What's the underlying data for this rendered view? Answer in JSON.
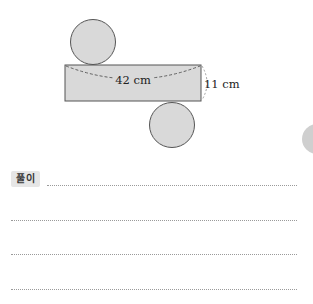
{
  "figure": {
    "width_label": "42 cm",
    "height_label": "11 cm",
    "colors": {
      "fill": "#d9d9d9",
      "stroke": "#555555",
      "dash": "#555555"
    }
  },
  "solution": {
    "badge_label": "풀이",
    "answer_lines": 4
  },
  "side_tab": {
    "label": "6"
  }
}
